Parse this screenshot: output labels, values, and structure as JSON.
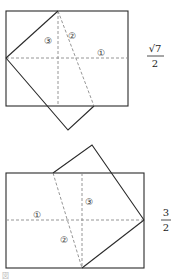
{
  "figures": [
    {
      "id": "top",
      "labels": {
        "crease1": "①",
        "crease2": "②",
        "crease3": "③"
      },
      "value": {
        "numerator": "√7",
        "denominator": "2"
      }
    },
    {
      "id": "bottom",
      "labels": {
        "crease1": "①",
        "crease2": "②",
        "crease3": "③"
      },
      "value": {
        "numerator": "3",
        "denominator": "2"
      }
    }
  ],
  "caption": "図"
}
